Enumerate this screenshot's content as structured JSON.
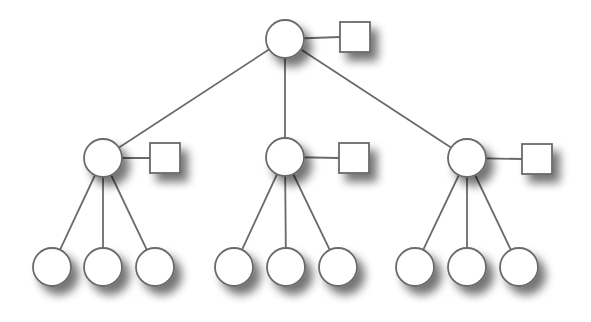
{
  "diagram": {
    "type": "tree",
    "colors": {
      "background": "#ffffff",
      "stroke": "#6a6a6a",
      "fill": "#ffffff",
      "shadow": "#555555"
    },
    "root": {
      "id": "root",
      "cx": 285,
      "cy": 39,
      "r": 19,
      "attachment": {
        "x": 340,
        "y": 22,
        "w": 30,
        "h": 30
      }
    },
    "middle": [
      {
        "id": "mid-left",
        "cx": 103,
        "cy": 158,
        "r": 19,
        "attachment": {
          "x": 150,
          "y": 143,
          "w": 30,
          "h": 30
        },
        "children": [
          {
            "cx": 52,
            "cy": 267
          },
          {
            "cx": 103,
            "cy": 267
          },
          {
            "cx": 155,
            "cy": 267
          }
        ]
      },
      {
        "id": "mid-center",
        "cx": 285,
        "cy": 157,
        "r": 19,
        "attachment": {
          "x": 339,
          "y": 143,
          "w": 30,
          "h": 30
        },
        "children": [
          {
            "cx": 234,
            "cy": 267
          },
          {
            "cx": 286,
            "cy": 267
          },
          {
            "cx": 338,
            "cy": 267
          }
        ]
      },
      {
        "id": "mid-right",
        "cx": 467,
        "cy": 158,
        "r": 19,
        "attachment": {
          "x": 522,
          "y": 144,
          "w": 30,
          "h": 30
        },
        "children": [
          {
            "cx": 415,
            "cy": 267
          },
          {
            "cx": 467,
            "cy": 267
          },
          {
            "cx": 519,
            "cy": 267
          }
        ]
      }
    ],
    "leaf_radius": 19
  }
}
